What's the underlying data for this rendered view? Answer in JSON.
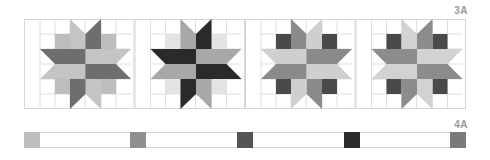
{
  "labels": {
    "top": "3A",
    "bottom": "4A"
  },
  "grid_color": "#d6d6d6",
  "panels": [
    {
      "name": "block-1",
      "bg_squares": "#bdbdbd",
      "corner_squares": null,
      "arms": {
        "up_left": "#c4c4c4",
        "up_right": "#6e6e6e",
        "right_top": "#c4c4c4",
        "right_bottom": "#6e6e6e",
        "down_right": "#c4c4c4",
        "down_left": "#6e6e6e",
        "left_bottom": "#c4c4c4",
        "left_top": "#6e6e6e"
      }
    },
    {
      "name": "block-2",
      "bg_squares": "#e4e4e4",
      "corner_squares": null,
      "arms": {
        "up_left": "#a8a8a8",
        "up_right": "#2a2a2a",
        "right_top": "#a8a8a8",
        "right_bottom": "#2a2a2a",
        "down_right": "#a8a8a8",
        "down_left": "#2a2a2a",
        "left_bottom": "#a8a8a8",
        "left_top": "#2a2a2a"
      }
    },
    {
      "name": "block-3",
      "bg_squares": null,
      "corner_squares": "#4a4a4a",
      "arms": {
        "up_left": "#8a8a8a",
        "up_right": "#cfcfcf",
        "right_top": "#8a8a8a",
        "right_bottom": "#cfcfcf",
        "down_right": "#8a8a8a",
        "down_left": "#cfcfcf",
        "left_bottom": "#8a8a8a",
        "left_top": "#cfcfcf"
      }
    },
    {
      "name": "block-4",
      "bg_squares": null,
      "corner_squares": "#4a4a4a",
      "arms": {
        "up_left": "#d2d2d2",
        "up_right": "#8c8c8c",
        "right_top": "#d2d2d2",
        "right_bottom": "#8c8c8c",
        "down_right": "#d2d2d2",
        "down_left": "#8c8c8c",
        "left_bottom": "#d2d2d2",
        "left_top": "#8c8c8c"
      }
    }
  ],
  "swatches": [
    {
      "name": "swatch-1",
      "x": 0,
      "color": "#bdbdbd"
    },
    {
      "name": "swatch-2",
      "x": 106,
      "color": "#8f8f8f"
    },
    {
      "name": "swatch-3",
      "x": 213,
      "color": "#545454"
    },
    {
      "name": "swatch-4",
      "x": 320,
      "color": "#2a2a2a"
    },
    {
      "name": "swatch-5",
      "x": 426,
      "color": "#7a7a7a"
    }
  ]
}
